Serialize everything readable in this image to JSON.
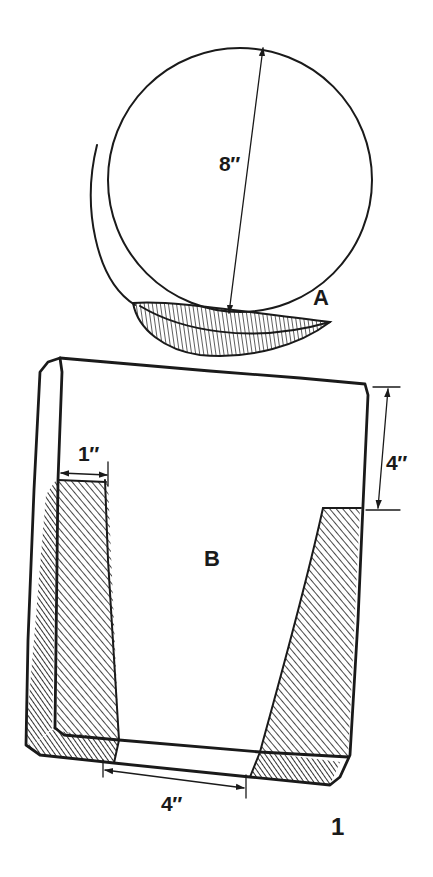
{
  "figure": {
    "number": "1",
    "ink_color": "#1a1a1a",
    "background_color": "#ffffff"
  },
  "part_a": {
    "label": "A",
    "shape": "disc (circular blank) with hatched crescent-shaped bevel at bottom edge",
    "dimensions": {
      "diameter": "8″"
    }
  },
  "part_b": {
    "label": "B",
    "shape": "rectangular block with hatched tapered side cuts forming a trapezoidal recess",
    "dimensions": {
      "side_wall_thickness": "1″",
      "recess_depth_from_top": "4″",
      "bottom_opening_width": "4″"
    }
  },
  "icons": {
    "dimension_arrow": "double-headed-arrow",
    "hatching": "diagonal-hatch"
  }
}
